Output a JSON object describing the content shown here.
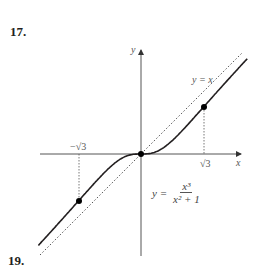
{
  "problems": {
    "top": "17.",
    "bottom": "19."
  },
  "chart_data": {
    "type": "line",
    "title": "",
    "xlabel": "x",
    "ylabel": "y",
    "series": [
      {
        "name": "y = x^3/(x^2+1)",
        "style": "solid",
        "function": "x^3/(x^2+1)"
      },
      {
        "name": "y = x",
        "style": "dotted",
        "function": "x"
      }
    ],
    "points": [
      {
        "x": -1.732,
        "y": -1.299,
        "label": "inflection"
      },
      {
        "x": 0,
        "y": 0,
        "label": "origin"
      },
      {
        "x": 1.732,
        "y": 1.299,
        "label": "inflection"
      }
    ],
    "xticks": [
      "−√3",
      "√3"
    ],
    "annotations": [
      "y = x",
      "y = x³/(x² + 1)"
    ],
    "xlim": [
      -2.8,
      2.8
    ],
    "ylim": [
      -2.8,
      2.9
    ],
    "grid": false
  },
  "labels": {
    "y_axis": "y",
    "x_axis": "x",
    "asymptote": "y = x",
    "neg_root3": "−√3",
    "pos_root3": "√3",
    "eq_lhs": "y =",
    "eq_num": "x³",
    "eq_den": "x² + 1"
  }
}
